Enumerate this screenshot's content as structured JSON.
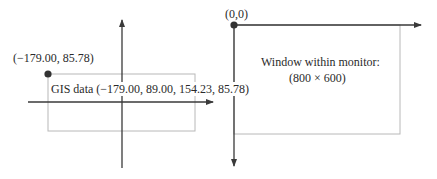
{
  "left_panel": {
    "corner_label": "(−179.00, 85.78)",
    "box_label": "GIS data (−179.00, 89.00, 154.23, 85.78)"
  },
  "right_panel": {
    "origin_label": "(0,0)",
    "window_label_line1": "Window within monitor:",
    "window_label_line2": "(800 × 600)"
  },
  "colors": {
    "axis": "#3a3a3a",
    "box": "#b8b8b8"
  }
}
